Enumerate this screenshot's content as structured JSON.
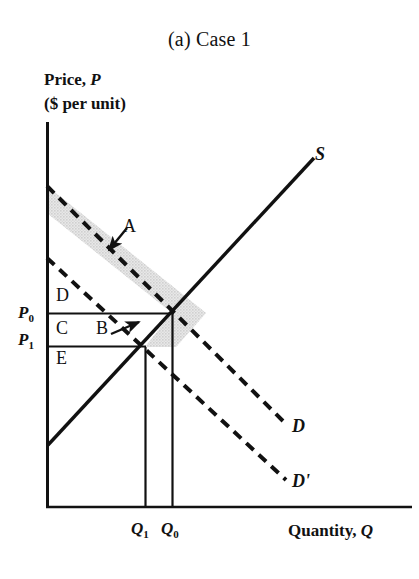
{
  "figure": {
    "title": "(a) Case 1",
    "y_axis_label_line1": "Price, P",
    "y_axis_label_line2": "($ per unit)",
    "x_axis_label": "Quantity, Q"
  },
  "ticks": {
    "price_high": "P",
    "price_high_sub": "0",
    "price_low": "P",
    "price_low_sub": "1",
    "qty_low": "Q",
    "qty_low_sub": "1",
    "qty_high": "Q",
    "qty_high_sub": "0"
  },
  "curves": {
    "supply_label": "S",
    "demand_label": "D",
    "demand_shifted_label": "D'"
  },
  "regions": {
    "a": "A",
    "b": "B",
    "c": "C",
    "d": "D",
    "e": "E"
  },
  "colors": {
    "ink": "#111111",
    "shade": "#d6d6d6",
    "background": "#ffffff"
  },
  "chart_data": {
    "type": "line",
    "title": "(a) Case 1",
    "xlabel": "Quantity, Q",
    "ylabel": "Price, P ($ per unit)",
    "grid": false,
    "legend": "inline-curve-labels",
    "xlim": [
      0,
      100
    ],
    "ylim": [
      0,
      100
    ],
    "series": [
      {
        "name": "S",
        "style": "solid",
        "role": "supply",
        "points": [
          [
            0,
            16
          ],
          [
            100,
            100
          ]
        ],
        "label": "S",
        "label_at": [
          88,
          92
        ]
      },
      {
        "name": "D",
        "style": "dashed",
        "role": "demand-original",
        "points": [
          [
            0,
            84
          ],
          [
            64,
            34
          ]
        ],
        "label": "D",
        "label_at": [
          68,
          22
        ]
      },
      {
        "name": "D'",
        "style": "dashed",
        "role": "demand-shifted",
        "points": [
          [
            0,
            65
          ],
          [
            64,
            16
          ]
        ],
        "label": "D'",
        "label_at": [
          68,
          8
        ]
      }
    ],
    "equilibria": [
      {
        "name": "initial",
        "price_label": "P0",
        "quantity_label": "Q0",
        "x": 33,
        "y": 50
      },
      {
        "name": "new",
        "price_label": "P1",
        "quantity_label": "Q1",
        "x": 26,
        "y": 42
      }
    ],
    "shaded_regions": [
      {
        "label": "A",
        "description": "band between D and D' above P0",
        "fill": "#d6d6d6"
      },
      {
        "label": "B",
        "description": "triangle between P0, P1 and the two demand curves",
        "fill": "#d6d6d6"
      }
    ],
    "unshaded_regions": [
      {
        "label": "D",
        "description": "rectangle above P0 left of Q1"
      },
      {
        "label": "C",
        "description": "rectangle between P1 and P0"
      },
      {
        "label": "E",
        "description": "rectangle below P1"
      }
    ],
    "annotations": [
      {
        "text": "A",
        "points_to": "shaded band between demand curves",
        "arrow": true
      },
      {
        "text": "B",
        "points_to": "small shaded triangle near equilibria",
        "arrow": true
      }
    ]
  }
}
